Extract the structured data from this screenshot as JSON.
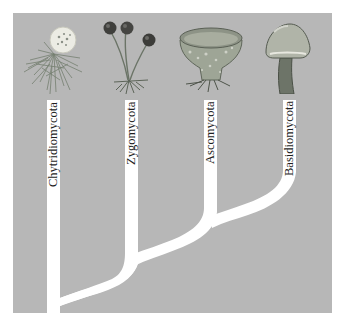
{
  "diagram": {
    "type": "phylogenetic-tree",
    "colors": {
      "background": "#ffffff",
      "panel": "#b7b7b7",
      "branch": "#ffffff",
      "label_text": "#1e1e1e"
    },
    "taxa": [
      {
        "name": "Chytridiomycota",
        "organism": "chytrid-sporangium-with-rhizoids"
      },
      {
        "name": "Zygomycota",
        "organism": "zygomycete-sporangiophores"
      },
      {
        "name": "Ascomycota",
        "organism": "cup-fungus-ascocarp"
      },
      {
        "name": "Basidiomycota",
        "organism": "mushroom-basidiocarp"
      }
    ]
  }
}
